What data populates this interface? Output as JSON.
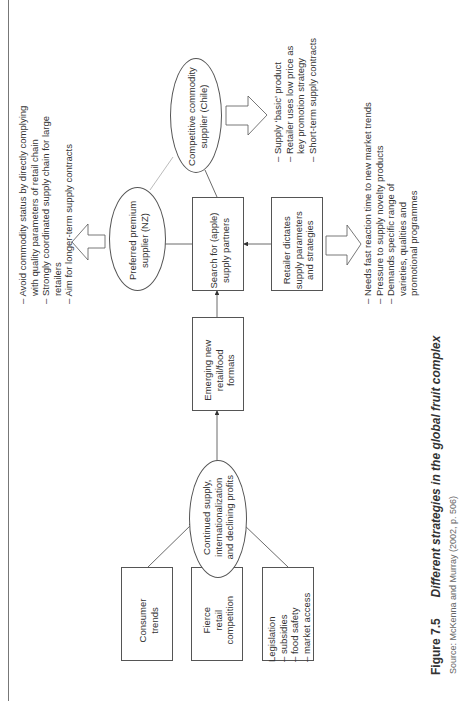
{
  "diagram": {
    "drivers": [
      {
        "label": "Consumer\ntrends"
      },
      {
        "label": "Fierce\nretail\ncompetition"
      },
      {
        "label": "Legislation\n– subsidies\n– food safety\n– market access"
      }
    ],
    "central_ellipse": "Continued supply,\ninternationalization\nand declining profits",
    "emerging_box": "Emerging new\nretail/food\nformats",
    "search_box": "Search for (apple)\nsupply partners",
    "retailer_box": "Retailer dictates\nsupply parameters\nand strategies",
    "premium_ellipse": "Preferred premium\nsupplier (NZ)",
    "commodity_ellipse": "Competitive commodity\nsupplier (Chile)",
    "premium_notes": [
      "– Avoid commodity status by directly complying",
      "   with quality parameters of retail chain",
      "– Strongly coordinated supply chain for large",
      "   retailers",
      "– Aim for longer-term supply contracts"
    ],
    "commodity_notes": [
      "– Supply ‘basic’ product",
      "– Retailer uses low price as",
      "   key promotion strategy",
      "– Short-term supply contracts"
    ],
    "retailer_notes": [
      "– Needs fast reaction time to new market trends",
      "– Pressure to supply novelty products",
      "– Demands specific range of",
      "   varieties, qualities and",
      "   promotional programmes"
    ]
  },
  "caption": {
    "figure_number": "Figure 7.5",
    "title": "Different strategies in the global fruit complex",
    "source": "Source: McKenna and Murray (2002, p. 506)"
  }
}
